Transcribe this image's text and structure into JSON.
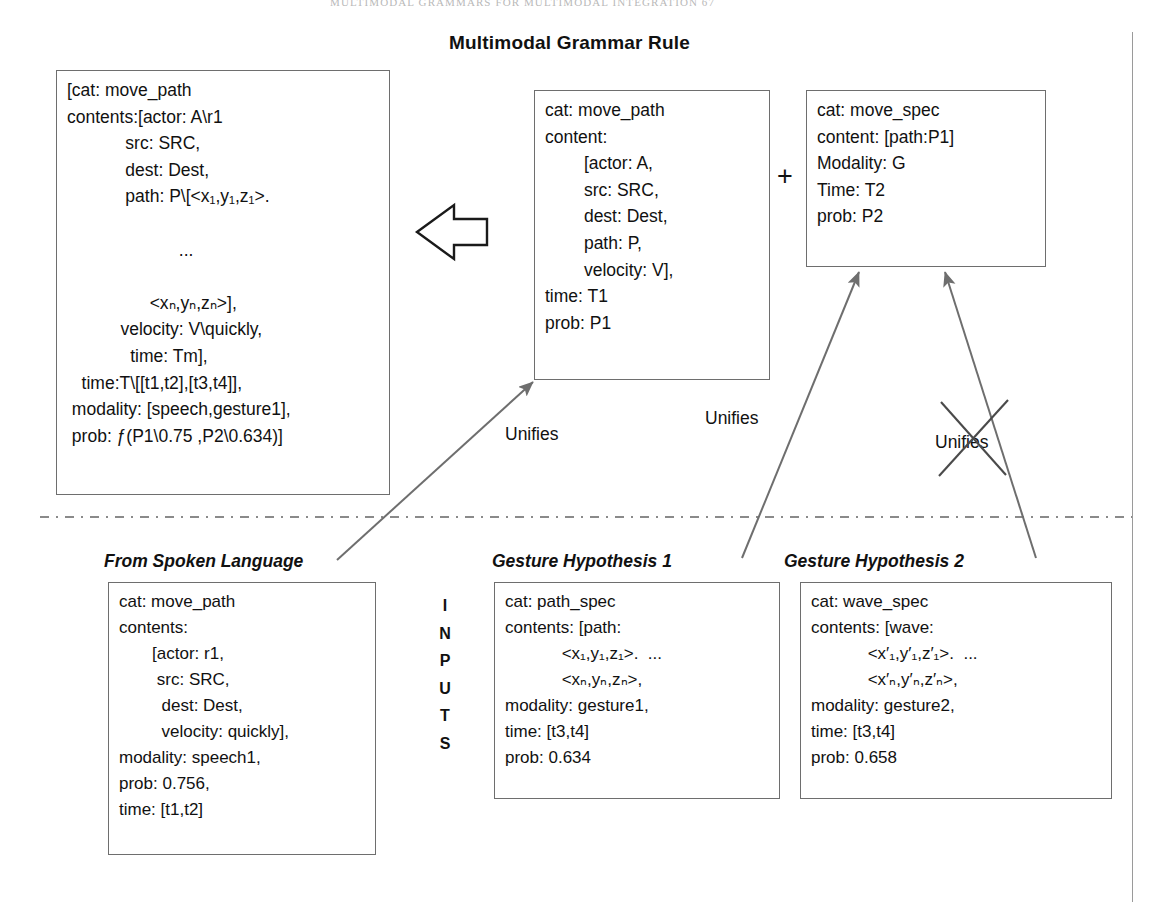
{
  "page": {
    "running_head": "MULTIMODAL GRAMMARS FOR MULTIMODAL INTEGRATION     67",
    "figure_title": "Multimodal Grammar Rule"
  },
  "result_box": {
    "name": "unified-result",
    "lines": [
      "[cat: move_path",
      "contents:[actor: A\\r1",
      "            src: SRC,",
      "            dest: Dest,",
      "            path: P\\[<x₁,y₁,z₁>.",
      "",
      "                       ...",
      "",
      "                 <xₙ,yₙ,zₙ>],",
      "           velocity: V\\quickly,",
      "             time: Tm],",
      "   time:T\\[[t1,t2],[t3,t4]],",
      " modality: [speech,gesture1],",
      " prob: ƒ(P1\\0.75 ,P2\\0.634)]"
    ]
  },
  "center_box": {
    "name": "move-path-rule",
    "lines": [
      "cat: move_path",
      "content:",
      "        [actor: A,",
      "        src: SRC,",
      "        dest: Dest,",
      "        path: P,",
      "        velocity: V],",
      "time: T1",
      "prob: P1"
    ]
  },
  "right_box": {
    "name": "move-spec-rule",
    "lines": [
      "cat: move_spec",
      "content: [path:P1]",
      "Modality: G",
      "Time: T2",
      "prob: P2"
    ]
  },
  "operator": {
    "plus": "+"
  },
  "inputs_label": {
    "letters": [
      "I",
      "N",
      "P",
      "U",
      "T",
      "S"
    ]
  },
  "unifies_labels": [
    {
      "text": "Unifies",
      "struck": false
    },
    {
      "text": "Unifies",
      "struck": false
    },
    {
      "text": "Unifies",
      "struck": true
    }
  ],
  "inputs": [
    {
      "caption": "From Spoken Language",
      "name": "spoken-language-input",
      "lines": [
        "cat: move_path",
        "contents:",
        "       [actor: r1,",
        "        src: SRC,",
        "         dest: Dest,",
        "         velocity: quickly],",
        "modality: speech1,",
        "prob: 0.756,",
        "time: [t1,t2]"
      ]
    },
    {
      "caption": "Gesture Hypothesis 1",
      "name": "gesture-hypothesis-1",
      "lines": [
        "cat: path_spec",
        "contents: [path:",
        "            <x₁,y₁,z₁>.  ...",
        "            <xₙ,yₙ,zₙ>,",
        "modality: gesture1,",
        "time: [t3,t4]",
        "prob: 0.634"
      ]
    },
    {
      "caption": "Gesture Hypothesis 2",
      "name": "gesture-hypothesis-2",
      "lines": [
        "cat: wave_spec",
        "contents: [wave:",
        "            <x′₁,y′₁,z′₁>.  ...",
        "            <x′ₙ,y′ₙ,z′ₙ>,",
        "modality: gesture2,",
        "time: [t3,t4]",
        "prob: 0.658"
      ]
    }
  ],
  "colors": {
    "box_border": "#6e6e6e",
    "connector": "#6e6e6e",
    "divider": "#8a8a8a",
    "text": "#111111"
  }
}
